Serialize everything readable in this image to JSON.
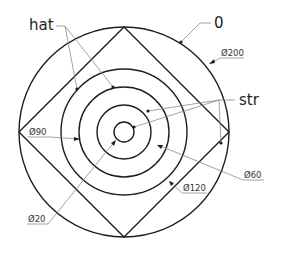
{
  "drawing": {
    "center": {
      "x": 124,
      "y": 132
    },
    "outer_circle_radius": 105,
    "inner_circle_radii": [
      10,
      27,
      45,
      63
    ],
    "diamond_inscribed": true,
    "stroke_color": "#1e1e1e",
    "leader_color": "#8a8a8a"
  },
  "labels": {
    "hat": "hat",
    "zero": "0",
    "str": "str"
  },
  "dimensions": {
    "d200": "Ø200",
    "d90": "Ø90",
    "d60": "Ø60",
    "d120": "Ø120",
    "d20": "Ø20"
  }
}
